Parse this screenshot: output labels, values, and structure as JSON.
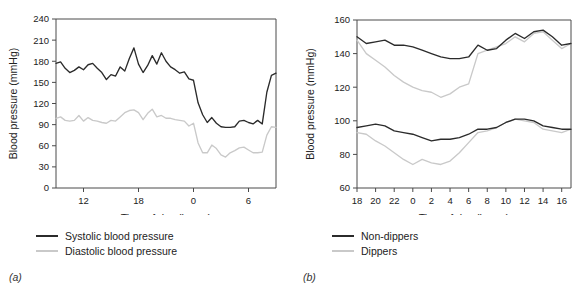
{
  "figure": {
    "panels": [
      {
        "tag": "(a)"
      },
      {
        "tag": "(b)"
      }
    ]
  },
  "panel_a": {
    "tag": "(a)",
    "ylabel": "Blood pressure (mmHg)",
    "xlabel": "Time of day (hours)",
    "y_ticks": [
      "0",
      "30",
      "60",
      "90",
      "120",
      "150",
      "180",
      "210",
      "240"
    ],
    "x_ticks": [
      "12",
      "18",
      "0",
      "6"
    ],
    "legend": [
      {
        "label": "Systolic blood pressure",
        "color": "#2b2b2b",
        "style": "dark"
      },
      {
        "label": "Diastolic blood pressure",
        "color": "#c9c9c9",
        "style": "light"
      }
    ]
  },
  "panel_b": {
    "tag": "(b)",
    "ylabel": "Blood pressure (mmHg)",
    "xlabel": "Time of day (hours)",
    "y_ticks": [
      "60",
      "80",
      "100",
      "120",
      "140",
      "160"
    ],
    "x_ticks": [
      "18",
      "20",
      "22",
      "0",
      "2",
      "4",
      "6",
      "8",
      "10",
      "12",
      "14",
      "16"
    ],
    "legend": [
      {
        "label": "Non-dippers",
        "color": "#2b2b2b",
        "style": "dark"
      },
      {
        "label": "Dippers",
        "color": "#c9c9c9",
        "style": "light"
      }
    ]
  },
  "chart_data": [
    {
      "type": "line",
      "panel": "(a)",
      "title": "",
      "xlabel": "Time of day (hours)",
      "ylabel": "Blood pressure (mmHg)",
      "ylim": [
        0,
        240
      ],
      "ytick_step": 30,
      "yticks": [
        0,
        30,
        60,
        90,
        120,
        150,
        180,
        210,
        240
      ],
      "xlim": [
        9.0,
        33.0
      ],
      "xticks_hours": [
        12,
        18,
        0,
        6
      ],
      "xticks_value": [
        12,
        18,
        24,
        30
      ],
      "grid": false,
      "legend_position": "below-axes-left",
      "x": [
        9.0,
        9.5,
        10.0,
        10.5,
        11.0,
        11.5,
        12.0,
        12.5,
        13.0,
        13.5,
        14.0,
        14.5,
        15.0,
        15.5,
        16.0,
        16.5,
        17.0,
        17.5,
        18.0,
        18.5,
        19.0,
        19.5,
        20.0,
        20.5,
        21.0,
        21.5,
        22.0,
        22.5,
        23.0,
        23.5,
        24.0,
        24.5,
        25.0,
        25.5,
        26.0,
        26.5,
        27.0,
        27.5,
        28.0,
        28.5,
        29.0,
        29.5,
        30.0,
        30.5,
        31.0,
        31.5,
        32.0,
        32.5,
        33.0
      ],
      "series": [
        {
          "name": "Systolic blood pressure",
          "color": "#2b2b2b",
          "values": [
            177,
            179,
            170,
            164,
            167,
            172,
            168,
            175,
            177,
            170,
            164,
            154,
            161,
            159,
            172,
            166,
            184,
            199,
            176,
            164,
            174,
            188,
            176,
            192,
            180,
            172,
            168,
            163,
            165,
            155,
            153,
            121,
            104,
            93,
            100,
            92,
            87,
            86,
            86,
            87,
            95,
            96,
            93,
            91,
            96,
            91,
            136,
            160,
            163
          ]
        },
        {
          "name": "Diastolic blood pressure",
          "color": "#c9c9c9",
          "values": [
            99,
            101,
            96,
            95,
            96,
            103,
            95,
            100,
            96,
            95,
            93,
            92,
            96,
            95,
            101,
            107,
            110,
            111,
            107,
            97,
            106,
            112,
            101,
            103,
            99,
            99,
            97,
            96,
            95,
            88,
            92,
            64,
            50,
            50,
            61,
            56,
            47,
            44,
            50,
            53,
            57,
            58,
            54,
            50,
            50,
            51,
            75,
            87,
            86
          ]
        }
      ]
    },
    {
      "type": "line",
      "panel": "(b)",
      "title": "",
      "xlabel": "Time of day (hours)",
      "ylabel": "Blood pressure (mmHg)",
      "ylim": [
        60,
        160
      ],
      "ytick_step": 20,
      "yticks": [
        60,
        80,
        100,
        120,
        140,
        160
      ],
      "xlim": [
        18,
        41
      ],
      "xticks_hours": [
        18,
        20,
        22,
        0,
        2,
        4,
        6,
        8,
        10,
        12,
        14,
        16
      ],
      "xticks_value": [
        18,
        20,
        22,
        24,
        26,
        28,
        30,
        32,
        34,
        36,
        38,
        40
      ],
      "grid": false,
      "legend_position": "below-axes-left",
      "x": [
        18,
        19,
        20,
        21,
        22,
        23,
        24,
        25,
        26,
        27,
        28,
        29,
        30,
        31,
        32,
        33,
        34,
        35,
        36,
        37,
        38,
        39,
        40,
        41
      ],
      "series": [
        {
          "name": "Non-dippers systolic",
          "color": "#2b2b2b",
          "values": [
            150,
            146,
            147,
            148,
            145,
            145,
            144,
            142,
            140,
            138,
            137,
            137,
            138,
            145,
            142,
            143,
            148,
            152,
            149,
            153,
            154,
            150,
            145,
            146
          ]
        },
        {
          "name": "Dippers systolic",
          "color": "#c9c9c9",
          "values": [
            148,
            140,
            136,
            132,
            127,
            123,
            120,
            118,
            117,
            114,
            116,
            120,
            122,
            140,
            142,
            144,
            146,
            150,
            147,
            152,
            153,
            148,
            143,
            146
          ]
        },
        {
          "name": "Non-dippers diastolic",
          "color": "#2b2b2b",
          "values": [
            96,
            97,
            98,
            97,
            94,
            93,
            92,
            90,
            88,
            89,
            89,
            90,
            92,
            95,
            95,
            96,
            99,
            101,
            101,
            100,
            97,
            96,
            95,
            95
          ]
        },
        {
          "name": "Dippers diastolic",
          "color": "#c9c9c9",
          "values": [
            93,
            92,
            88,
            85,
            81,
            77,
            74,
            77,
            75,
            74,
            76,
            81,
            87,
            93,
            94,
            96,
            99,
            101,
            100,
            99,
            95,
            94,
            93,
            95
          ]
        }
      ]
    }
  ]
}
